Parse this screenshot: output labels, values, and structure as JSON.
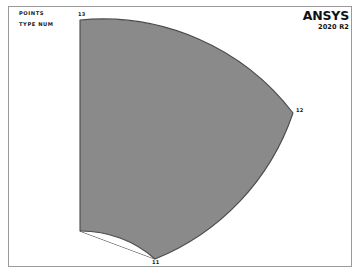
{
  "window": {
    "name": "ansys-graphics-window",
    "background_color": "#ffffff",
    "frame_color": "#9a9a9a"
  },
  "legend": {
    "line1": "POINTS",
    "line2": "TYPE NUM"
  },
  "brand": {
    "name": "ANSYS",
    "version": "2020 R2"
  },
  "geometry": {
    "description": "annular sector",
    "fill_color": "#8a8a8a",
    "stroke_color": "#4a4a4a",
    "keypoints": [
      {
        "id": "13",
        "x": 80,
        "y": 20
      },
      {
        "id": "12",
        "x": 293,
        "y": 113
      },
      {
        "id": "11",
        "x": 155,
        "y": 259
      }
    ],
    "labels": {
      "kp13": "13",
      "kp12": "12",
      "kp11": "11"
    }
  }
}
